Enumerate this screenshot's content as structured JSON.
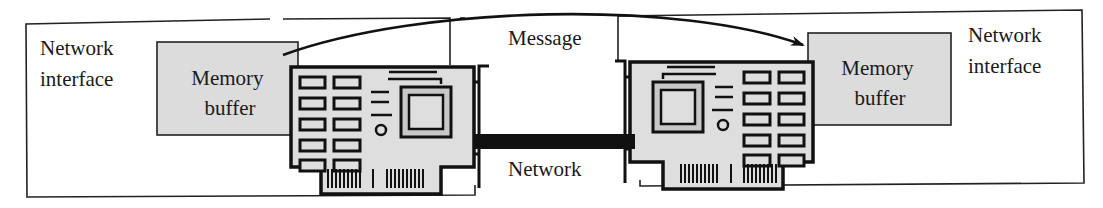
{
  "diagram": {
    "type": "network-message-passing",
    "left_node": {
      "label_line1": "Network",
      "label_line2": "interface",
      "buffer_line1": "Memory",
      "buffer_line2": "buffer"
    },
    "right_node": {
      "label_line1": "Network",
      "label_line2": "interface",
      "buffer_line1": "Memory",
      "buffer_line2": "buffer"
    },
    "message_label": "Message",
    "network_label": "Network",
    "edges": [
      {
        "from": "left_node.memory_buffer",
        "to": "right_node.memory_buffer",
        "label": "Message",
        "style": "curved-arrow"
      },
      {
        "from": "left_node.card",
        "to": "right_node.card",
        "label": "Network",
        "style": "thick-cable"
      }
    ],
    "colors": {
      "buffer_fill": "#dcdcdc",
      "card_fill": "#dedede",
      "chip_inner_fill": "#c8c8c8",
      "line": "#111111"
    }
  }
}
